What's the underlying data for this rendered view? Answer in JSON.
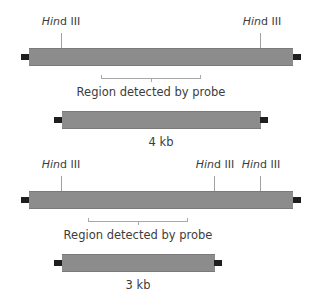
{
  "diagram": {
    "panels": [
      {
        "id": "top",
        "sites": [
          {
            "italic": "Hin",
            "plain": "d III",
            "x": 61
          },
          {
            "italic": "Hin",
            "plain": "d III",
            "x": 260
          }
        ],
        "probe_label": "Region detected by probe",
        "fragment_label": "4 kb"
      },
      {
        "id": "bottom",
        "sites": [
          {
            "italic": "Hin",
            "plain": "d III",
            "x": 61
          },
          {
            "italic": "Hin",
            "plain": "d III",
            "x": 214
          },
          {
            "italic": "Hin",
            "plain": "d III",
            "x": 260
          }
        ],
        "probe_label": "Region detected by probe",
        "fragment_label": "3 kb"
      }
    ],
    "colors": {
      "dna_bar": "#8c8c8c",
      "end_cap": "#1e1e1e",
      "tick": "#a0a0a0",
      "text": "#3c3c3c"
    }
  }
}
